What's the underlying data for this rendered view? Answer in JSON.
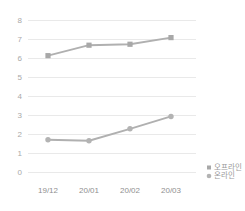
{
  "chart_data": {
    "type": "line",
    "title": "",
    "subtitle": "",
    "xlabel": "",
    "ylabel": "",
    "categories": [
      "19/12",
      "20/01",
      "20/02",
      "20/03"
    ],
    "series": [
      {
        "name": "오프라인",
        "marker": "square",
        "color": "#a8a8a8",
        "values": [
          6.15,
          6.7,
          6.75,
          7.1
        ]
      },
      {
        "name": "온라인",
        "marker": "circle",
        "color": "#b3b3b3",
        "values": [
          1.72,
          1.67,
          2.3,
          2.95
        ]
      }
    ],
    "ylim": [
      0,
      8
    ],
    "yticks": [
      0,
      1,
      2,
      3,
      4,
      5,
      6,
      7,
      8
    ],
    "ytick_labels": [
      "0",
      "1",
      "2",
      "3",
      "4",
      "5",
      "6",
      "7",
      "8"
    ],
    "grid": true,
    "grid_color": "#e9e9e9",
    "legend_position": "right-bottom",
    "legend": [
      {
        "label": "오프라인",
        "marker": "square",
        "color": "#a8a8a8"
      },
      {
        "label": "온라인",
        "marker": "circle",
        "color": "#b3b3b3"
      }
    ],
    "background": "#ffffff"
  },
  "axes": {
    "y_labels": [
      "8",
      "7",
      "6",
      "5",
      "4",
      "3",
      "2",
      "1",
      "0"
    ],
    "x_labels": [
      "19/12",
      "20/01",
      "20/02",
      "20/03"
    ]
  },
  "legend": {
    "item0": "오프라인",
    "item1": "온라인"
  }
}
